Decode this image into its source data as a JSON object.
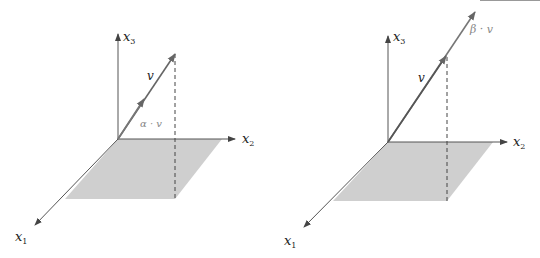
{
  "figure": {
    "colors": {
      "axis": "#555555",
      "vector": "#666666",
      "plane_fill": "#cfcfcf",
      "dashed": "#444444",
      "label": "#222222",
      "label_secondary": "#888888"
    },
    "panels": [
      {
        "id": "left",
        "axes": {
          "x1": {
            "base": "x",
            "sub": "1"
          },
          "x2": {
            "base": "x",
            "sub": "2"
          },
          "x3": {
            "base": "x",
            "sub": "3"
          }
        },
        "vector_label": "v",
        "scaled_label": "α · v",
        "description": "scaled vector α·v shorter than v"
      },
      {
        "id": "right",
        "axes": {
          "x1": {
            "base": "x",
            "sub": "1"
          },
          "x2": {
            "base": "x",
            "sub": "2"
          },
          "x3": {
            "base": "x",
            "sub": "3"
          }
        },
        "vector_label": "v",
        "scaled_label": "β · v",
        "description": "scaled vector β·v longer than v"
      }
    ]
  }
}
